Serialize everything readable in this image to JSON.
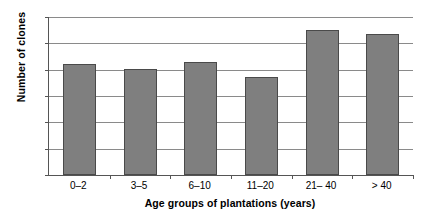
{
  "chart_data": {
    "type": "bar",
    "title": "",
    "xlabel": "Age groups of plantations (years)",
    "ylabel": "Number of clones",
    "categories": [
      "0–2",
      "3–5",
      "6–10",
      "11–20",
      "21– 40",
      "> 40"
    ],
    "values": [
      21.0,
      20.2,
      21.4,
      18.6,
      27.5,
      26.7
    ],
    "series": [
      {
        "name": "Number of clones",
        "values": [
          21.0,
          20.2,
          21.4,
          18.6,
          27.5,
          26.7
        ]
      }
    ],
    "ylim": [
      0,
      30
    ],
    "yticks": [
      0,
      5,
      10,
      15,
      20,
      25,
      30
    ],
    "ytick_labels": [
      "0",
      "5",
      "10",
      "15",
      "20",
      "25",
      "30"
    ],
    "grid": "horizontal",
    "legend": "none",
    "bar_color": "#7f7f7f",
    "bar_border_color": "#4a4a4a",
    "gridline_color": "#8a8a8a",
    "axis_color": "#555555",
    "background_color": "#ffffff"
  }
}
